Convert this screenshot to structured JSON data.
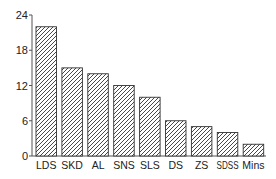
{
  "chart_data": {
    "type": "bar",
    "title": "",
    "xlabel": "",
    "ylabel": "",
    "categories": [
      "LDS",
      "SKD",
      "AL",
      "SNS",
      "SLS",
      "DS",
      "ZS",
      "SDSS",
      "Mins"
    ],
    "values": [
      22,
      15,
      14,
      12,
      10,
      6,
      5,
      4,
      2
    ],
    "ylim": [
      0,
      24
    ],
    "yticks": [
      0,
      6,
      12,
      18,
      24
    ],
    "grid": false,
    "legend": null,
    "bar_style": "diagonal-hatch",
    "colors": {
      "bar_fill": "#ffffff",
      "hatch": "#333333",
      "axis": "#555555"
    }
  }
}
